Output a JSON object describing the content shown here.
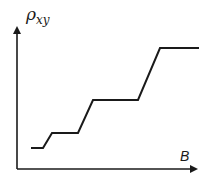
{
  "diagram": {
    "y_axis_label": "ρ",
    "y_axis_subscript": "xy",
    "x_axis_label": "B",
    "colors": {
      "line": "#1a1a1a",
      "background": "#ffffff"
    }
  },
  "chart_data": {
    "type": "line",
    "title": "",
    "xlabel": "B",
    "ylabel": "ρ_xy",
    "grid": false,
    "legend": null,
    "series": [
      {
        "name": "rho_xy",
        "points_px": [
          [
            31,
            148
          ],
          [
            43,
            148
          ],
          [
            52,
            133
          ],
          [
            78,
            133
          ],
          [
            93,
            100
          ],
          [
            138,
            100
          ],
          [
            160,
            48
          ],
          [
            199,
            48
          ]
        ]
      }
    ]
  }
}
